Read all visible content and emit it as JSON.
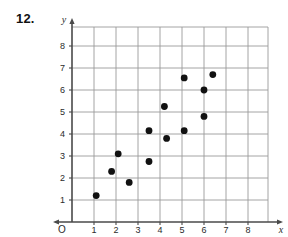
{
  "problem": {
    "number": "12."
  },
  "chart_data": {
    "type": "scatter",
    "title": "",
    "xlabel": "x",
    "ylabel": "y",
    "origin_label": "O",
    "xlim": [
      0,
      9
    ],
    "ylim": [
      0,
      9
    ],
    "xticks": [
      1,
      2,
      3,
      4,
      5,
      6,
      7,
      8
    ],
    "yticks": [
      1,
      2,
      3,
      4,
      5,
      6,
      7,
      8
    ],
    "xtick_labels": [
      "1",
      "2",
      "3",
      "4",
      "5",
      "6",
      "7",
      "8"
    ],
    "ytick_labels": [
      "1",
      "2",
      "3",
      "4",
      "5",
      "6",
      "7",
      "8"
    ],
    "grid": true,
    "grid_color": "#9a9a9a",
    "axis_color": "#4a4a4a",
    "point_color": "#111111",
    "point_radius": 3.4,
    "legend": null,
    "points": [
      {
        "x": 1.1,
        "y": 1.2
      },
      {
        "x": 1.8,
        "y": 2.3
      },
      {
        "x": 2.1,
        "y": 3.1
      },
      {
        "x": 2.6,
        "y": 1.8
      },
      {
        "x": 3.5,
        "y": 2.75
      },
      {
        "x": 3.5,
        "y": 4.15
      },
      {
        "x": 4.2,
        "y": 5.25
      },
      {
        "x": 4.3,
        "y": 3.8
      },
      {
        "x": 5.1,
        "y": 6.55
      },
      {
        "x": 5.1,
        "y": 4.15
      },
      {
        "x": 6.0,
        "y": 6.0
      },
      {
        "x": 6.0,
        "y": 4.8
      },
      {
        "x": 6.4,
        "y": 6.7
      }
    ]
  },
  "geometry": {
    "origin_px": {
      "x": 72,
      "y": 222
    },
    "unit_px": 22,
    "plot_right_px": 268,
    "plot_top_px": 27
  }
}
